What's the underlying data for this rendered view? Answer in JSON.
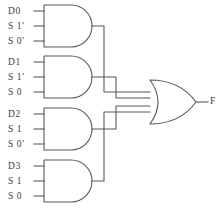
{
  "diagram": {
    "stroke_color": "#595959",
    "background_color": "#ffffff",
    "text_color": "#3d3d3d",
    "output": {
      "label": "F"
    },
    "gates": [
      {
        "name": "and-gate-1",
        "type": "AND",
        "inputs": [
          "D0",
          "S 1'",
          "S 0'"
        ]
      },
      {
        "name": "and-gate-2",
        "type": "AND",
        "inputs": [
          "D1",
          "S 1'",
          "S 0"
        ]
      },
      {
        "name": "and-gate-3",
        "type": "AND",
        "inputs": [
          "D2",
          "S 1",
          "S 0'"
        ]
      },
      {
        "name": "and-gate-4",
        "type": "AND",
        "inputs": [
          "D3",
          "S 1",
          "S 0"
        ]
      }
    ],
    "or_gate": {
      "name": "or-gate",
      "type": "OR",
      "input_count": 4
    }
  }
}
